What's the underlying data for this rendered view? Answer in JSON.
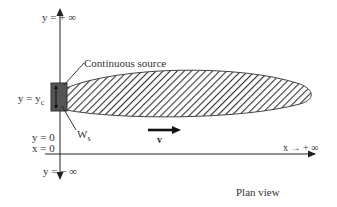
{
  "diagram": {
    "title": "Plan view",
    "labels": {
      "y_pos_inf": "y = + ∞",
      "y_neg_inf": "y = − ∞",
      "y_yc": "y = y",
      "y_yc_sub": "c",
      "y_zero": "y = 0",
      "x_zero": "x = 0",
      "x_pos_inf": "x → + ∞",
      "continuous_source": "Continuous source",
      "ws": "W",
      "ws_sub": "s",
      "velocity": "v"
    },
    "colors": {
      "axis": "#222222",
      "source_fill": "#555555",
      "plume_outline": "#444444",
      "hatch": "#333333"
    }
  }
}
